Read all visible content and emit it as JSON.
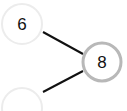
{
  "diagram": {
    "type": "tree",
    "nodes": [
      {
        "id": "n6",
        "label": "6",
        "cx": 22,
        "cy": 24,
        "r": 20,
        "stroke": "#ececec",
        "stroke_width": 2
      },
      {
        "id": "n8",
        "label": "8",
        "cx": 102,
        "cy": 62,
        "r": 19,
        "stroke": "#b8b8b8",
        "stroke_width": 3
      },
      {
        "id": "n_empty",
        "label": "",
        "cx": 22,
        "cy": 108,
        "r": 20,
        "stroke": "#ececec",
        "stroke_width": 2
      }
    ],
    "edges": [
      {
        "from": "n6",
        "to": "n8",
        "x1": 43,
        "y1": 32,
        "x2": 83,
        "y2": 54
      },
      {
        "from": "n_empty",
        "to": "n8",
        "x1": 43,
        "y1": 92,
        "x2": 83,
        "y2": 71
      }
    ],
    "colors": {
      "edge": "#111111",
      "text": "#111111",
      "background": "#ffffff"
    }
  }
}
